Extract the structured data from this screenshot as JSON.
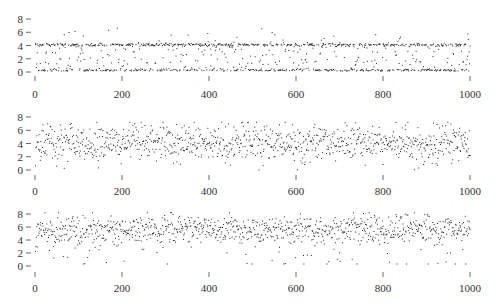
{
  "chart_data": [
    {
      "type": "scatter",
      "title": "",
      "xlabel": "",
      "ylabel": "",
      "xlim": [
        0,
        1000
      ],
      "ylim": [
        0,
        8
      ],
      "x_ticks": [
        0,
        200,
        400,
        600,
        800,
        1000
      ],
      "y_ticks": [
        0,
        2,
        4,
        6,
        8
      ],
      "grid": false,
      "legend": null,
      "description": "1000 points; bimodal clustering near y=4 and y=0 with sparse points between and a few up to ~6.5",
      "generator": {
        "seed": 11,
        "n": 1000,
        "mode": "bimodal",
        "hi": 4.1,
        "lo": 0.15,
        "p_hi": 0.45,
        "p_lo": 0.3
      }
    },
    {
      "type": "scatter",
      "title": "",
      "xlabel": "",
      "ylabel": "",
      "xlim": [
        0,
        1000
      ],
      "ylim": [
        0,
        8
      ],
      "x_ticks": [
        0,
        200,
        400,
        600,
        800,
        1000
      ],
      "y_ticks": [
        0,
        2,
        4,
        6,
        8
      ],
      "grid": false,
      "legend": null,
      "description": "1000 points; broad scatter centered near y=4, ranging ~0 to ~7",
      "generator": {
        "seed": 23,
        "n": 1000,
        "mode": "normal",
        "mean": 4.0,
        "sd": 1.45,
        "min": 0.0,
        "max": 7.2
      }
    },
    {
      "type": "scatter",
      "title": "",
      "xlabel": "",
      "ylabel": "",
      "xlim": [
        0,
        1000
      ],
      "ylim": [
        0,
        8
      ],
      "x_ticks": [
        0,
        200,
        400,
        600,
        800,
        1000
      ],
      "y_ticks": [
        0,
        2,
        4,
        6,
        8
      ],
      "grid": false,
      "legend": null,
      "description": "1000 points; scatter centered near y=5.5, mostly 3.5-8 with a tail down to ~0.5",
      "generator": {
        "seed": 37,
        "n": 1000,
        "mode": "skew",
        "mean": 5.6,
        "sd": 1.1,
        "min": 0.3,
        "max": 8.2
      }
    }
  ],
  "axes": {
    "y_tick_labels": [
      "8",
      "6",
      "4",
      "2",
      "0"
    ],
    "x_tick_labels": [
      "0",
      "200",
      "400",
      "600",
      "800",
      "1000"
    ]
  },
  "colors": {
    "point": "#222222",
    "axis": "#444444",
    "background": "#ffffff"
  }
}
